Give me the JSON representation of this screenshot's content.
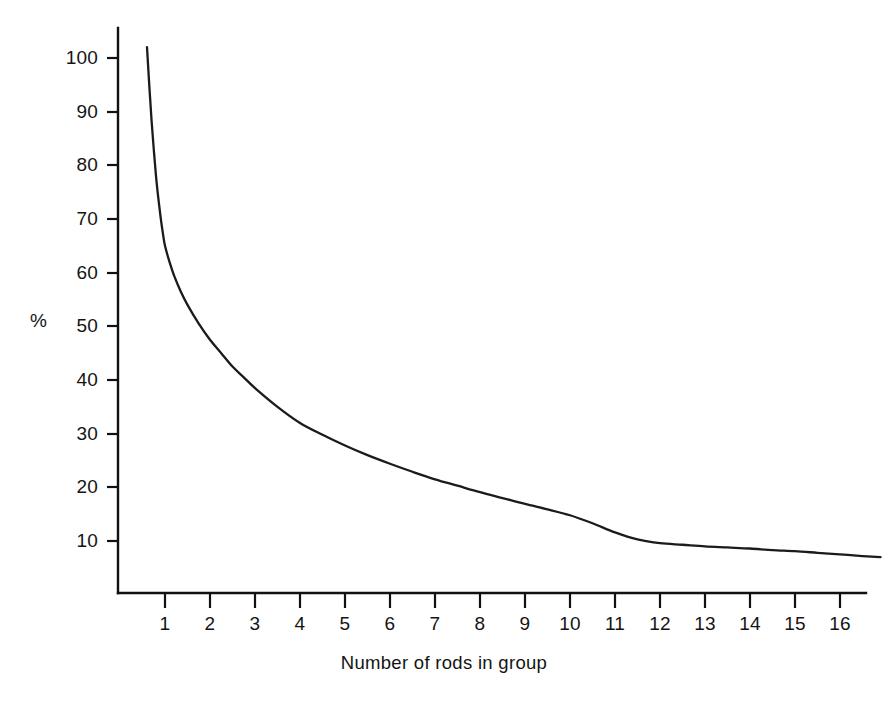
{
  "chart_data": {
    "type": "line",
    "title": "",
    "subtitle": "",
    "xlabel": "Number of rods in group",
    "ylabel": "%",
    "grid": false,
    "legend": null,
    "xlim": [
      0.5,
      17.0
    ],
    "ylim": [
      0,
      104
    ],
    "x_ticks": [
      1,
      2,
      3,
      4,
      5,
      6,
      7,
      8,
      9,
      10,
      11,
      12,
      13,
      14,
      15,
      16
    ],
    "x_tick_labels": [
      "1",
      "2",
      "3",
      "4",
      "5",
      "6",
      "7",
      "8",
      "9",
      "10",
      "11",
      "12",
      "13",
      "14",
      "15",
      "16"
    ],
    "y_ticks": [
      10,
      20,
      30,
      40,
      50,
      60,
      70,
      80,
      90,
      100
    ],
    "y_tick_labels": [
      "10",
      "20",
      "30",
      "40",
      "50",
      "60",
      "70",
      "80",
      "90",
      "100"
    ],
    "series": [
      {
        "name": "percentage",
        "color": "#1b1b1b",
        "x": [
          0.6,
          0.65,
          0.7,
          0.75,
          0.8,
          0.85,
          0.9,
          0.95,
          1.0,
          1.1,
          1.2,
          1.35,
          1.5,
          1.75,
          2.0,
          2.25,
          2.5,
          2.75,
          3.0,
          3.5,
          4.0,
          4.5,
          5.0,
          5.5,
          6.0,
          6.5,
          7.0,
          7.5,
          8.0,
          8.5,
          9.0,
          9.5,
          10.0,
          10.5,
          11.0,
          11.5,
          12.0,
          12.5,
          13.0,
          13.5,
          14.0,
          14.5,
          15.0,
          15.5,
          16.0,
          16.5,
          16.9
        ],
        "y": [
          102.0,
          95.0,
          88.5,
          83.0,
          78.0,
          74.0,
          70.5,
          67.5,
          65.0,
          62.0,
          59.5,
          56.5,
          54.0,
          50.5,
          47.5,
          45.0,
          42.5,
          40.5,
          38.5,
          35.0,
          32.0,
          29.8,
          27.8,
          26.0,
          24.4,
          22.9,
          21.5,
          20.3,
          19.1,
          18.0,
          16.9,
          15.9,
          14.8,
          13.3,
          11.6,
          10.3,
          9.6,
          9.3,
          9.0,
          8.8,
          8.6,
          8.3,
          8.1,
          7.8,
          7.5,
          7.2,
          7.0
        ]
      }
    ]
  },
  "axes": {
    "y_axis_title": "%",
    "x_axis_title": "Number of rods in group"
  }
}
